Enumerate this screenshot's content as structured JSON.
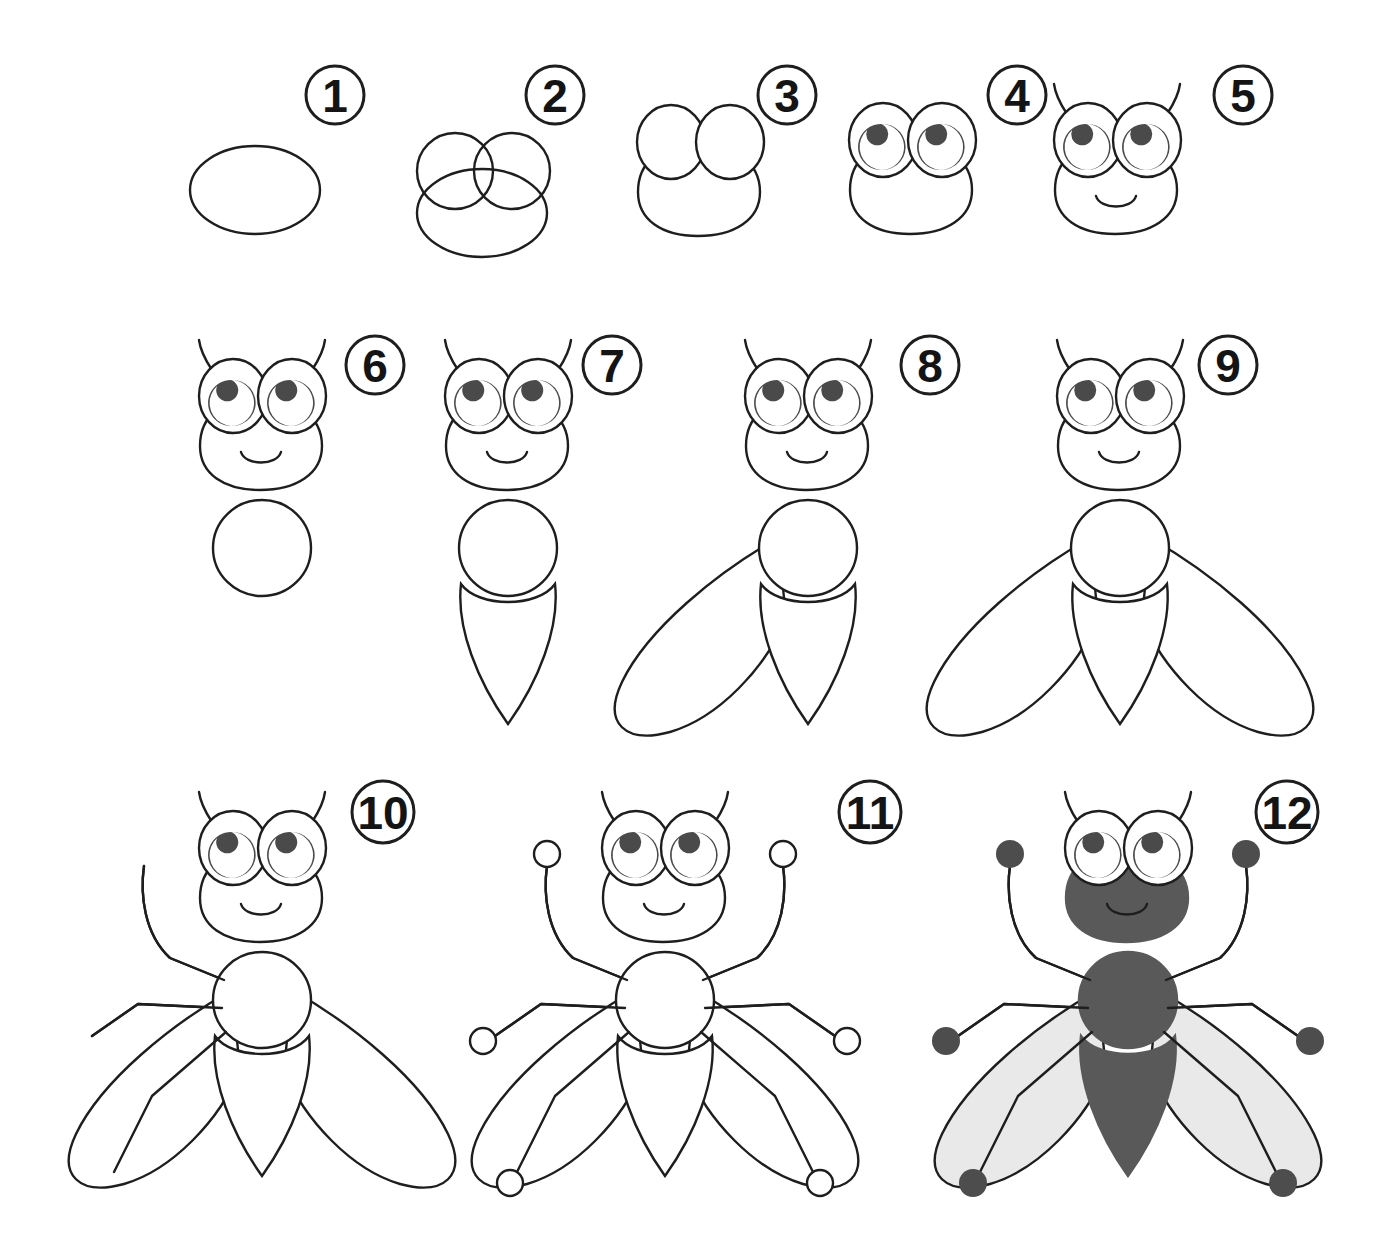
{
  "page": {
    "background_color": "#ffffff",
    "width": 1388,
    "height": 1249
  },
  "style": {
    "ink_color": "#1e1e1e",
    "stroke_width": 2.4,
    "badge_stroke_width": 3,
    "body_fill": "#595959",
    "wing_fill": "#e9e9e9",
    "eye_white": "#ffffff",
    "pupil_fill": "#4a4a4a",
    "foot_fill": "#4d4d4d",
    "paper_fill": "#ffffff"
  },
  "steps": [
    {
      "number": "1",
      "badge": {
        "cx": 335,
        "cy": 95,
        "r": 29
      },
      "caption": "Draw an oval for the head",
      "parts": [
        "head-oval"
      ]
    },
    {
      "number": "2",
      "badge": {
        "cx": 555,
        "cy": 95,
        "r": 29
      },
      "caption": "Add two overlapping circles for the eyes",
      "parts": [
        "head-oval",
        "eye-circle-left",
        "eye-circle-right"
      ]
    },
    {
      "number": "3",
      "badge": {
        "cx": 787,
        "cy": 95,
        "r": 29
      },
      "caption": "Erase the overlap lines",
      "parts": [
        "head-outline",
        "eye-outline-left",
        "eye-outline-right"
      ]
    },
    {
      "number": "4",
      "badge": {
        "cx": 1017,
        "cy": 95,
        "r": 29
      },
      "caption": "Draw the crescent pupils",
      "parts": [
        "head-outline",
        "eyes",
        "pupils"
      ]
    },
    {
      "number": "5",
      "badge": {
        "cx": 1243,
        "cy": 95,
        "r": 29
      },
      "caption": "Add antennae and a smile",
      "parts": [
        "head-outline",
        "eyes",
        "pupils",
        "antennae",
        "smile"
      ]
    },
    {
      "number": "6",
      "badge": {
        "cx": 375,
        "cy": 365,
        "r": 29
      },
      "caption": "Draw a round thorax below the head",
      "parts": [
        "head",
        "thorax"
      ]
    },
    {
      "number": "7",
      "badge": {
        "cx": 612,
        "cy": 365,
        "r": 29
      },
      "caption": "Add the pointed abdomen",
      "parts": [
        "head",
        "thorax",
        "abdomen"
      ]
    },
    {
      "number": "8",
      "badge": {
        "cx": 930,
        "cy": 365,
        "r": 29
      },
      "caption": "Draw the left wing",
      "parts": [
        "head",
        "thorax",
        "abdomen",
        "wing-left"
      ]
    },
    {
      "number": "9",
      "badge": {
        "cx": 1228,
        "cy": 365,
        "r": 29
      },
      "caption": "Draw the right wing",
      "parts": [
        "head",
        "thorax",
        "abdomen",
        "wing-left",
        "wing-right"
      ]
    },
    {
      "number": "10",
      "badge": {
        "cx": 383,
        "cy": 812,
        "r": 31
      },
      "caption": "Add the three left legs",
      "parts": [
        "body",
        "wings",
        "legs-left"
      ]
    },
    {
      "number": "11",
      "badge": {
        "cx": 870,
        "cy": 812,
        "r": 31
      },
      "caption": "Add the three right legs with round feet",
      "parts": [
        "body",
        "wings",
        "legs-left",
        "legs-right",
        "feet"
      ]
    },
    {
      "number": "12",
      "badge": {
        "cx": 1287,
        "cy": 812,
        "r": 31
      },
      "caption": "Colour it in",
      "parts": [
        "body-filled",
        "wings-filled",
        "legs",
        "feet-filled"
      ]
    }
  ],
  "figure_origins": {
    "step1": {
      "x": 255,
      "y": 190
    },
    "step2": {
      "x": 482,
      "y": 178
    },
    "step3": {
      "x": 700,
      "y": 178
    },
    "step4": {
      "x": 912,
      "y": 176
    },
    "step5": {
      "x": 1117,
      "y": 176
    },
    "step6": {
      "x": 262,
      "y": 432
    },
    "step7": {
      "x": 508,
      "y": 432
    },
    "step8": {
      "x": 808,
      "y": 432
    },
    "step9": {
      "x": 1120,
      "y": 432
    },
    "step10": {
      "x": 262,
      "y": 884
    },
    "step11": {
      "x": 665,
      "y": 884
    },
    "step12": {
      "x": 1128,
      "y": 884
    }
  },
  "legend": {
    "total_steps": 12,
    "subject": "fly",
    "rows": 3,
    "columns_per_row": [
      5,
      4,
      3
    ]
  }
}
